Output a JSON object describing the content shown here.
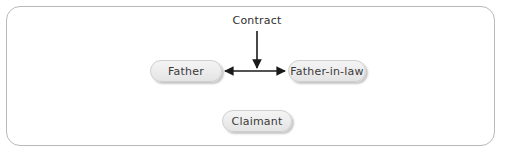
{
  "diagram": {
    "background_color": "#ffffff",
    "frame": {
      "border_color": "#b9b9b9",
      "corner_radius": 14
    },
    "nodes": [
      {
        "id": "father",
        "label": "Father",
        "x": 150,
        "y": 60,
        "width": 72,
        "height": 22
      },
      {
        "id": "father_in_law",
        "label": "Father-in-law",
        "x": 288,
        "y": 60,
        "width": 78,
        "height": 22
      },
      {
        "id": "claimant",
        "label": "Claimant",
        "x": 222,
        "y": 110,
        "width": 70,
        "height": 22
      }
    ],
    "edges": [
      {
        "id": "father-father-in-law",
        "label": "Contract",
        "from": "father",
        "to": "father_in_law",
        "style": "double-headed-horizontal-arrow",
        "color": "#1a1a1a"
      },
      {
        "id": "contract-to-link",
        "from": "Contract",
        "to": "father-father-in-law",
        "style": "single-headed-down-arrow",
        "color": "#1a1a1a"
      }
    ],
    "node_style": {
      "fill_top": "#f4f4f4",
      "fill_bottom": "#e4e4e4",
      "border_color": "#cfcfcf",
      "text_color": "#3a3a3a"
    }
  },
  "labels": {
    "contract": "Contract",
    "father": "Father",
    "father_in_law": "Father-in-law",
    "claimant": "Claimant"
  }
}
